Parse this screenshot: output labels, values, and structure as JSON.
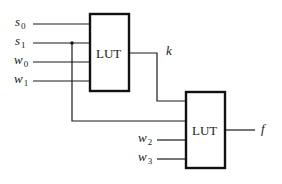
{
  "diagram": {
    "colors": {
      "line": "#1a1a1a",
      "box_border": "#111111",
      "background": "#ffffff"
    },
    "lut1": {
      "label": "LUT"
    },
    "lut2": {
      "label": "LUT"
    },
    "inputs": [
      {
        "name": "s",
        "sub": "0"
      },
      {
        "name": "s",
        "sub": "1"
      },
      {
        "name": "w",
        "sub": "0"
      },
      {
        "name": "w",
        "sub": "1"
      },
      {
        "name": "w",
        "sub": "2"
      },
      {
        "name": "w",
        "sub": "3"
      }
    ],
    "intermediate": {
      "name": "k"
    },
    "output": {
      "name": "f"
    }
  }
}
